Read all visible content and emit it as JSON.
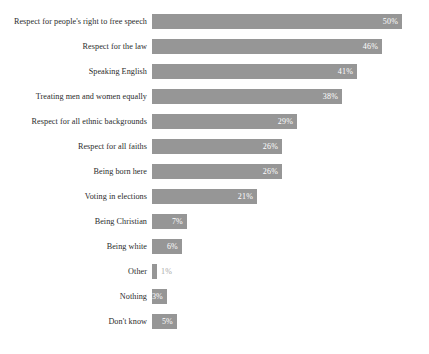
{
  "chart_data": {
    "type": "bar",
    "orientation": "horizontal",
    "title": "",
    "subtitle": "",
    "xlabel": "",
    "ylabel": "",
    "xlim": [
      0,
      50
    ],
    "grid": false,
    "legend": false,
    "value_suffix": "%",
    "bar_color": "#969696",
    "label_color": "#2b2b2b",
    "inside_value_color": "#ffffff",
    "outside_value_color": "#a8a8a8",
    "background_color": "#ffffff",
    "categories": [
      "Respect for people's right to free speech",
      "Respect for the law",
      "Speaking English",
      "Treating men and women equally",
      "Respect for all ethnic backgrounds",
      "Respect for all faiths",
      "Being born here",
      "Voting in elections",
      "Being Christian",
      "Being white",
      "Other",
      "Nothing",
      "Don't know"
    ],
    "values": [
      50,
      46,
      41,
      38,
      29,
      26,
      26,
      21,
      7,
      6,
      1,
      3,
      5
    ],
    "value_labels": [
      "50%",
      "46%",
      "41%",
      "38%",
      "29%",
      "26%",
      "26%",
      "21%",
      "7%",
      "6%",
      "1%",
      "3%",
      "5%"
    ],
    "label_placement": [
      "inside",
      "inside",
      "inside",
      "inside",
      "inside",
      "inside",
      "inside",
      "inside",
      "inside",
      "inside",
      "outside",
      "inside",
      "inside"
    ],
    "bars": [
      {
        "category": "Respect for people's right to free speech",
        "value": 50,
        "label": "50%",
        "placement": "inside"
      },
      {
        "category": "Respect for the law",
        "value": 46,
        "label": "46%",
        "placement": "inside"
      },
      {
        "category": "Speaking English",
        "value": 41,
        "label": "41%",
        "placement": "inside"
      },
      {
        "category": "Treating men and women equally",
        "value": 38,
        "label": "38%",
        "placement": "inside"
      },
      {
        "category": "Respect for all ethnic backgrounds",
        "value": 29,
        "label": "29%",
        "placement": "inside"
      },
      {
        "category": "Respect for all faiths",
        "value": 26,
        "label": "26%",
        "placement": "inside"
      },
      {
        "category": "Being born here",
        "value": 26,
        "label": "26%",
        "placement": "inside"
      },
      {
        "category": "Voting in elections",
        "value": 21,
        "label": "21%",
        "placement": "inside"
      },
      {
        "category": "Being Christian",
        "value": 7,
        "label": "7%",
        "placement": "inside"
      },
      {
        "category": "Being white",
        "value": 6,
        "label": "6%",
        "placement": "inside"
      },
      {
        "category": "Other",
        "value": 1,
        "label": "1%",
        "placement": "outside"
      },
      {
        "category": "Nothing",
        "value": 3,
        "label": "3%",
        "placement": "inside"
      },
      {
        "category": "Don't know",
        "value": 5,
        "label": "5%",
        "placement": "inside"
      }
    ]
  }
}
